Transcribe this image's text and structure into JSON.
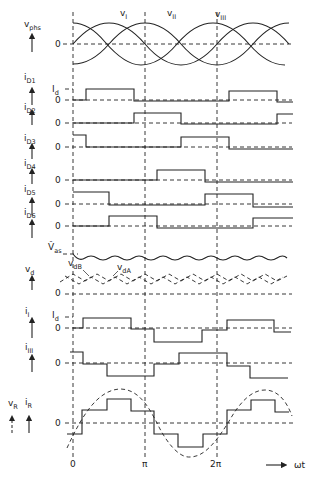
{
  "colors": {
    "line": "#222222",
    "background": "#ffffff"
  },
  "x_axis": {
    "label": "ωt",
    "ticks": [
      "0",
      "π",
      "2π"
    ],
    "tick_x": [
      73,
      145,
      217
    ],
    "arrow": "arrow-right"
  },
  "top_labels": {
    "vI": "v",
    "vI_sub": "I",
    "vII": "v",
    "vII_sub": "II",
    "vIII": "v",
    "vIII_sub": "III"
  },
  "panels": [
    {
      "id": "vphs",
      "label": "v",
      "sub": "phs",
      "zero": "0"
    },
    {
      "id": "iD1",
      "label": "i",
      "sub": "D1",
      "level_label": "I",
      "level_sub": "d",
      "zero": "0"
    },
    {
      "id": "iD2",
      "label": "i",
      "sub": "D2",
      "zero": "0"
    },
    {
      "id": "iD3",
      "label": "i",
      "sub": "D3",
      "zero": "0"
    },
    {
      "id": "iD4",
      "label": "i",
      "sub": "D4",
      "zero": "0"
    },
    {
      "id": "iD5",
      "label": "i",
      "sub": "D5",
      "zero": "0"
    },
    {
      "id": "iD6",
      "label": "i",
      "sub": "D6",
      "zero": "0"
    },
    {
      "id": "vd",
      "label": "v",
      "sub": "d",
      "zero": "0",
      "peak_label": "V̂",
      "peak_sub": "as",
      "trace_b": "v",
      "trace_b_sub": "dB",
      "trace_a": "v",
      "trace_a_sub": "dA"
    },
    {
      "id": "iI",
      "label": "i",
      "sub": "I",
      "level_label": "I",
      "level_sub": "d",
      "zero": "0"
    },
    {
      "id": "iIII",
      "label": "i",
      "sub": "III",
      "zero": "0"
    },
    {
      "id": "vRiR",
      "label": "v",
      "sub": "R",
      "label2": "i",
      "sub2": "R",
      "zero": "0"
    }
  ]
}
